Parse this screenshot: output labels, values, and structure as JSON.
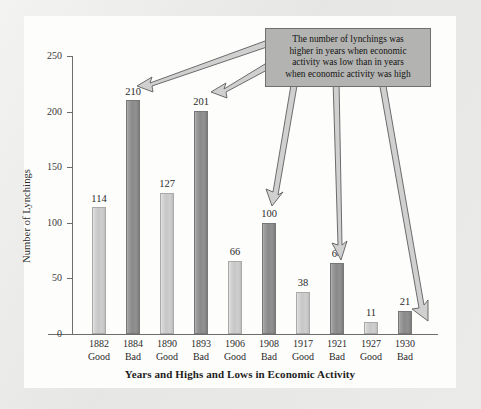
{
  "chart_data": {
    "type": "bar",
    "title": "",
    "xlabel": "Years and Highs and Lows in Economic Activity",
    "ylabel": "Number of Lynchings",
    "ylim": [
      0,
      250
    ],
    "yticks": [
      0,
      50,
      100,
      150,
      200,
      250
    ],
    "ytick_labels": [
      "0",
      "50",
      "100",
      "150",
      "200",
      "250"
    ],
    "grid": false,
    "legend": "none",
    "categories": [
      "1882 Good",
      "1884 Bad",
      "1890 Good",
      "1893 Bad",
      "1906 Good",
      "1908 Bad",
      "1917 Good",
      "1921 Bad",
      "1927 Good",
      "1930 Bad"
    ],
    "values": [
      114,
      210,
      127,
      201,
      66,
      100,
      38,
      64,
      11,
      21
    ],
    "bars": [
      {
        "year": "1882",
        "condition": "Good",
        "value": 114,
        "value_label": "114",
        "style": "good"
      },
      {
        "year": "1884",
        "condition": "Bad",
        "value": 210,
        "value_label": "210",
        "style": "bad"
      },
      {
        "year": "1890",
        "condition": "Good",
        "value": 127,
        "value_label": "127",
        "style": "good"
      },
      {
        "year": "1893",
        "condition": "Bad",
        "value": 201,
        "value_label": "201",
        "style": "bad"
      },
      {
        "year": "1906",
        "condition": "Good",
        "value": 66,
        "value_label": "66",
        "style": "good"
      },
      {
        "year": "1908",
        "condition": "Bad",
        "value": 100,
        "value_label": "100",
        "style": "bad"
      },
      {
        "year": "1917",
        "condition": "Good",
        "value": 38,
        "value_label": "38",
        "style": "good"
      },
      {
        "year": "1921",
        "condition": "Bad",
        "value": 64,
        "value_label": "64",
        "style": "bad"
      },
      {
        "year": "1927",
        "condition": "Good",
        "value": 11,
        "value_label": "11",
        "style": "good"
      },
      {
        "year": "1930",
        "condition": "Bad",
        "value": 21,
        "value_label": "21",
        "style": "bad"
      }
    ],
    "annotations": [
      {
        "text": "The number of lynchings was higher in years when economic activity was low than in years when economic activity was high",
        "lines": [
          "The number of lynchings was",
          "higher in years when economic",
          "activity was low than in years",
          "when economic activity was high"
        ],
        "points_to": [
          "1884 Bad",
          "1893 Bad",
          "1908 Bad",
          "1921 Bad",
          "1930 Bad"
        ]
      }
    ],
    "colors": {
      "good_bar": "#c7c7c7",
      "bad_bar": "#8a8a8a",
      "axis": "#6d6d6d",
      "annotation_box": "#b3b3b1",
      "annotation_border": "#6f6f6f",
      "arrow_fill": "#d0d0d0",
      "arrow_stroke": "#5e5e5e",
      "plot_background": "#fdfdfc",
      "page_background": "#e9e9e7",
      "text": "#2a2a2a"
    }
  }
}
